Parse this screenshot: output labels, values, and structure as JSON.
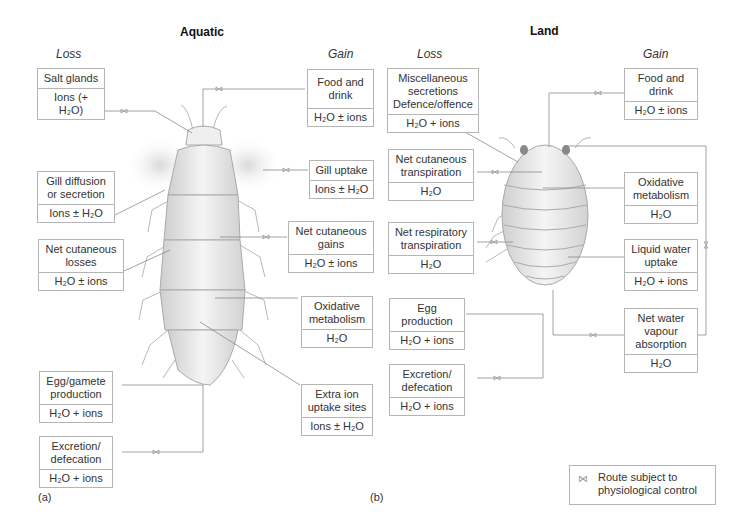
{
  "panels": {
    "aquatic": {
      "title": "Aquatic",
      "loss_heading": "Loss",
      "gain_heading": "Gain",
      "label": "(a)",
      "loss_boxes": [
        {
          "name": "Salt glands",
          "content": "Ions (+ H₂O)",
          "controlled": true
        },
        {
          "name": "Gill diffusion\nor secretion",
          "content": "Ions ± H₂O",
          "controlled": true
        },
        {
          "name": "Net cutaneous\nlosses",
          "content": "H₂O ± ions",
          "controlled": true
        },
        {
          "name": "Egg/gamete\nproduction",
          "content": "H₂O + ions",
          "controlled": false
        },
        {
          "name": "Excretion/\ndefecation",
          "content": "H₂O +  ions",
          "controlled": true
        }
      ],
      "gain_boxes": [
        {
          "name": "Food and\ndrink",
          "content": "H₂O ± ions",
          "controlled": true
        },
        {
          "name": "Gill uptake",
          "content": "Ions ± H₂O",
          "controlled": true
        },
        {
          "name": "Net cutaneous\ngains",
          "content": "H₂O ± ions",
          "controlled": true
        },
        {
          "name": "Oxidative\nmetabolism",
          "content": "H₂O",
          "controlled": false
        },
        {
          "name": "Extra ion\nuptake sites",
          "content": "Ions ± H₂O",
          "controlled": true
        }
      ]
    },
    "land": {
      "title": "Land",
      "loss_heading": "Loss",
      "gain_heading": "Gain",
      "label": "(b)",
      "loss_boxes": [
        {
          "name": "Miscellaneous\nsecretions\nDefence/offence",
          "content": "H₂O + ions",
          "controlled": false
        },
        {
          "name": "Net cutaneous\ntranspiration",
          "content": "H₂O",
          "controlled": true
        },
        {
          "name": "Net respiratory\ntranspiration",
          "content": "H₂O",
          "controlled": true
        },
        {
          "name": "Egg\nproduction",
          "content": "H₂O + ions",
          "controlled": false
        },
        {
          "name": "Excretion/\ndefecation",
          "content": "H₂O + ions",
          "controlled": true
        }
      ],
      "gain_boxes": [
        {
          "name": "Food and\ndrink",
          "content": "H₂O ± ions",
          "controlled": true
        },
        {
          "name": "Oxidative\nmetabolism",
          "content": "H₂O",
          "controlled": false
        },
        {
          "name": "Liquid water\nuptake",
          "content": "H₂O + ions",
          "controlled": false
        },
        {
          "name": "Net water\nvapour\nabsorption",
          "content": "H₂O",
          "controlled": true
        }
      ]
    }
  },
  "legend": {
    "symbol": "⋈",
    "text": "Route subject to\nphysiological control"
  },
  "colors": {
    "line": "#8a8a8a",
    "box_border": "#b5b5b5",
    "body_fill": "#e9e9e9"
  }
}
